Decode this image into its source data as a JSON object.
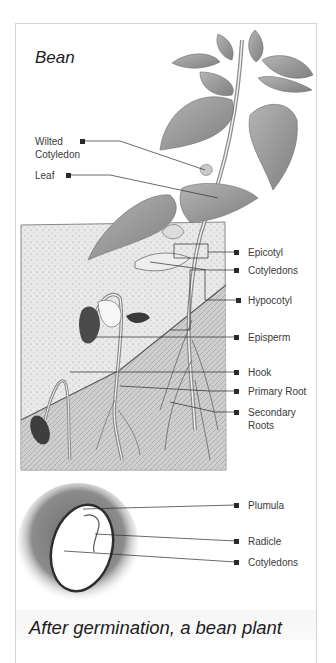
{
  "diagram": {
    "title": "Bean",
    "caption": "After germination, a bean plant",
    "colors": {
      "background": "#ffffff",
      "card_border": "#d6d6d6",
      "label_text": "#3a3a3a",
      "leader_line": "#2a2a2a",
      "leaf_gray": "#9c9c9c",
      "soil_gray": "#e4e4e4",
      "seed_halo": "#7a7a7a"
    },
    "labels_left": [
      {
        "id": "wilted-cotyledon",
        "text_line1": "Wilted",
        "text_line2": "Cotyledon"
      },
      {
        "id": "leaf",
        "text": "Leaf"
      }
    ],
    "labels_right": [
      {
        "id": "epicotyl",
        "text": "Epicotyl"
      },
      {
        "id": "cotyledons-upper",
        "text": "Cotyledons"
      },
      {
        "id": "hypocotyl",
        "text": "Hypocotyl"
      },
      {
        "id": "episperm",
        "text": "Episperm"
      },
      {
        "id": "hook",
        "text": "Hook"
      },
      {
        "id": "primary-root",
        "text": "Primary Root"
      },
      {
        "id": "secondary-roots",
        "text_line1": "Secondary",
        "text_line2": "Roots"
      },
      {
        "id": "plumula",
        "text": "Plumula"
      },
      {
        "id": "radicle",
        "text": "Radicle"
      },
      {
        "id": "cotyledons-lower",
        "text": "Cotyledons"
      }
    ]
  }
}
